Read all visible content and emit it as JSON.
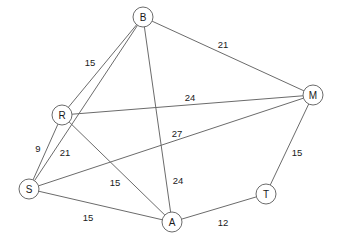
{
  "diagram": {
    "type": "weighted-undirected-graph",
    "title": "",
    "colors": {
      "background": "#ffffff",
      "stroke": "#6b6b6b",
      "text": "#1a1a1a",
      "node_fill": "#ffffff"
    },
    "nodes": [
      {
        "id": "B",
        "label": "B",
        "x": 143,
        "y": 17,
        "r": 10
      },
      {
        "id": "M",
        "label": "M",
        "x": 313,
        "y": 95,
        "r": 10
      },
      {
        "id": "R",
        "label": "R",
        "x": 62,
        "y": 115,
        "r": 10
      },
      {
        "id": "S",
        "label": "S",
        "x": 29,
        "y": 189,
        "r": 10
      },
      {
        "id": "A",
        "label": "A",
        "x": 172,
        "y": 222,
        "r": 10
      },
      {
        "id": "T",
        "label": "T",
        "x": 266,
        "y": 194,
        "r": 10
      }
    ],
    "edges": [
      {
        "from": "B",
        "to": "R",
        "weight": "15",
        "label_x": 90,
        "label_y": 62
      },
      {
        "from": "B",
        "to": "S",
        "weight": "21",
        "label_x": 65,
        "label_y": 152
      },
      {
        "from": "B",
        "to": "A",
        "weight": "24",
        "label_x": 178,
        "label_y": 180
      },
      {
        "from": "B",
        "to": "M",
        "weight": "21",
        "label_x": 223,
        "label_y": 44
      },
      {
        "from": "R",
        "to": "M",
        "weight": "24",
        "label_x": 190,
        "label_y": 97
      },
      {
        "from": "R",
        "to": "S",
        "weight": "9",
        "label_x": 38,
        "label_y": 148
      },
      {
        "from": "R",
        "to": "A",
        "weight": "15",
        "label_x": 115,
        "label_y": 182
      },
      {
        "from": "S",
        "to": "M",
        "weight": "27",
        "label_x": 177,
        "label_y": 133
      },
      {
        "from": "S",
        "to": "A",
        "weight": "15",
        "label_x": 88,
        "label_y": 217
      },
      {
        "from": "A",
        "to": "T",
        "weight": "12",
        "label_x": 223,
        "label_y": 222
      },
      {
        "from": "M",
        "to": "T",
        "weight": "15",
        "label_x": 297,
        "label_y": 152
      }
    ]
  }
}
